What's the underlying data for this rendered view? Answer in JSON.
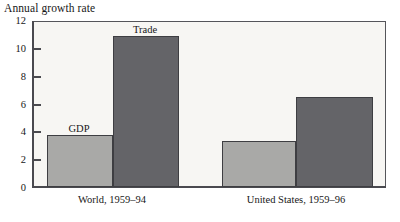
{
  "chart_data": {
    "type": "bar",
    "title": "Annual growth rate",
    "xlabel": "",
    "ylabel": "",
    "ylim": [
      0,
      12
    ],
    "yticks": [
      0,
      2,
      4,
      6,
      8,
      10,
      12
    ],
    "ytick_labels": [
      "0",
      "2",
      "4",
      "6",
      "8",
      "10",
      "12"
    ],
    "grid": false,
    "legend": "none",
    "categories": [
      "World, 1959–94",
      "United States, 1959–96"
    ],
    "series": [
      {
        "name": "GDP",
        "values": [
          3.7,
          3.2
        ],
        "color": "#a9a9a7"
      },
      {
        "name": "Trade",
        "values": [
          10.75,
          6.4
        ],
        "color": "#646468"
      }
    ],
    "annotations": [
      {
        "text": "GDP",
        "series": "GDP",
        "category": "World, 1959–94"
      },
      {
        "text": "Trade",
        "series": "Trade",
        "category": "World, 1959–94"
      }
    ]
  },
  "title": "Annual growth rate",
  "axis": {
    "y_labels": [
      "12",
      "10",
      "8",
      "6",
      "4",
      "2",
      "0"
    ]
  },
  "groups": [
    {
      "caption": "World, 1959–94",
      "bars": [
        {
          "label": "GDP",
          "value": 3.7,
          "tone": "light"
        },
        {
          "label": "Trade",
          "value": 10.75,
          "tone": "dark"
        }
      ]
    },
    {
      "caption": "United States, 1959–96",
      "bars": [
        {
          "label": "GDP",
          "value": 3.2,
          "tone": "light"
        },
        {
          "label": "Trade",
          "value": 6.4,
          "tone": "dark"
        }
      ]
    }
  ],
  "annotations": {
    "gdp": "GDP",
    "trade": "Trade"
  },
  "colors": {
    "light_bar": "#a9a9a7",
    "dark_bar": "#646468",
    "plot_background": "#f7f6f3",
    "axis": "#4a4a4f",
    "text": "#171717"
  }
}
